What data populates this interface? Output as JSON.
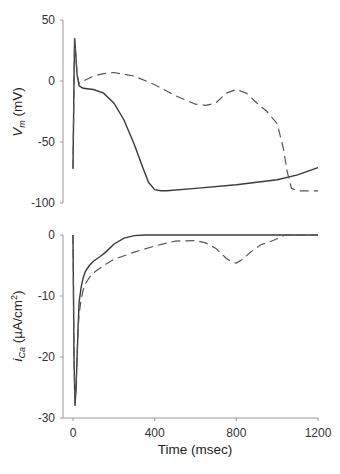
{
  "chart_data": [
    {
      "type": "line",
      "title": "",
      "xlabel": "",
      "ylabel": "V_m (mV)",
      "ylabel_main": "V",
      "ylabel_sub": "m",
      "ylabel_unit": " (mV)",
      "xlim": [
        0,
        1200
      ],
      "ylim": [
        -100,
        50
      ],
      "yticks": [
        50,
        0,
        -50,
        -100
      ],
      "grid": false,
      "series": [
        {
          "name": "solid",
          "style": "solid",
          "x": [
            0,
            5,
            8,
            12,
            20,
            30,
            50,
            100,
            150,
            200,
            250,
            300,
            340,
            370,
            400,
            430,
            460,
            600,
            800,
            1000,
            1100,
            1200
          ],
          "y": [
            -72,
            0,
            35,
            25,
            5,
            -4,
            -6,
            -7,
            -10,
            -18,
            -32,
            -52,
            -70,
            -83,
            -89,
            -90,
            -90,
            -88,
            -85,
            -81,
            -77,
            -71
          ]
        },
        {
          "name": "dashed",
          "style": "dashed",
          "x": [
            0,
            5,
            8,
            12,
            20,
            30,
            50,
            100,
            150,
            200,
            300,
            400,
            500,
            600,
            650,
            700,
            750,
            800,
            850,
            900,
            950,
            1000,
            1030,
            1050,
            1070,
            1100,
            1150,
            1200
          ],
          "y": [
            -72,
            0,
            35,
            25,
            5,
            -2,
            0,
            4,
            6,
            7,
            4,
            -3,
            -12,
            -19,
            -20,
            -18,
            -10,
            -7,
            -10,
            -18,
            -25,
            -35,
            -55,
            -75,
            -88,
            -90,
            -90,
            -90
          ]
        }
      ]
    },
    {
      "type": "line",
      "title": "",
      "xlabel": "Time (msec)",
      "ylabel": "i_Ca (µA/cm²)",
      "ylabel_main": "i",
      "ylabel_sub": "Ca",
      "ylabel_unit": " (µA/cm",
      "ylabel_sup": "2",
      "ylabel_close": ")",
      "xlim": [
        0,
        1200
      ],
      "ylim": [
        -30,
        0
      ],
      "xticks": [
        0,
        400,
        800,
        1200
      ],
      "yticks": [
        0,
        -10,
        -20,
        -30
      ],
      "grid": false,
      "series": [
        {
          "name": "solid",
          "style": "solid",
          "x": [
            0,
            5,
            10,
            15,
            20,
            25,
            30,
            40,
            50,
            60,
            80,
            100,
            130,
            160,
            200,
            250,
            300,
            350,
            400,
            600,
            800,
            1000,
            1200
          ],
          "y": [
            0,
            -20,
            -28,
            -25,
            -20,
            -15,
            -11,
            -8.5,
            -7,
            -6,
            -5,
            -4.3,
            -3.6,
            -2.8,
            -1.5,
            -0.5,
            -0.1,
            0,
            0,
            0,
            0,
            0,
            0
          ]
        },
        {
          "name": "dashed",
          "style": "dashed",
          "x": [
            0,
            5,
            10,
            15,
            20,
            25,
            30,
            40,
            50,
            60,
            80,
            100,
            130,
            160,
            200,
            300,
            400,
            500,
            600,
            650,
            700,
            750,
            780,
            800,
            830,
            870,
            920,
            980,
            1040,
            1200
          ],
          "y": [
            0,
            -20,
            -28,
            -25,
            -20,
            -15.5,
            -13,
            -10.5,
            -9,
            -8,
            -7,
            -6.2,
            -5.5,
            -4.8,
            -4,
            -2.8,
            -1.8,
            -1,
            -0.9,
            -1.3,
            -2.2,
            -3.8,
            -4.5,
            -4.6,
            -4,
            -2.8,
            -1.6,
            -0.9,
            0,
            0
          ]
        }
      ]
    }
  ],
  "axes": {
    "top": {
      "yticks": [
        "50",
        "0",
        "-50",
        "-100"
      ]
    },
    "bottom": {
      "yticks": [
        "0",
        "-10",
        "-20",
        "-30"
      ],
      "xticks": [
        "0",
        "400",
        "800",
        "1200"
      ],
      "xlabel": "Time (msec)"
    }
  }
}
